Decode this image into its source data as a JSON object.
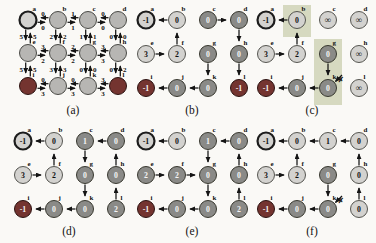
{
  "figure": {
    "colors": {
      "node_light": "#d3d2cf",
      "node_mid": "#b7b6b3",
      "node_dark": "#8a8a87",
      "node_red": "#743430",
      "source_ring": "#1c1c1c",
      "edge": "#141414",
      "shade": "#d6d9c0",
      "text_dark": "#111111",
      "text_light": "#f5f5f5",
      "label": "#111111"
    },
    "panels": [
      {
        "id": "a",
        "caption": "(a)",
        "type": "weighted",
        "nodes": [
          {
            "id": "a",
            "col": 0,
            "row": 0,
            "style": "source"
          },
          {
            "id": "b",
            "col": 1,
            "row": 0,
            "style": "mid"
          },
          {
            "id": "c",
            "col": 2,
            "row": 0,
            "style": "mid"
          },
          {
            "id": "d",
            "col": 3,
            "row": 0,
            "style": "mid"
          },
          {
            "id": "e",
            "col": 0,
            "row": 1,
            "style": "mid"
          },
          {
            "id": "f",
            "col": 1,
            "row": 1,
            "style": "mid"
          },
          {
            "id": "g",
            "col": 2,
            "row": 1,
            "style": "mid"
          },
          {
            "id": "h",
            "col": 3,
            "row": 1,
            "style": "mid"
          },
          {
            "id": "i",
            "col": 0,
            "row": 2,
            "style": "red"
          },
          {
            "id": "j",
            "col": 1,
            "row": 2,
            "style": "mid"
          },
          {
            "id": "k",
            "col": 2,
            "row": 2,
            "style": "mid"
          },
          {
            "id": "l",
            "col": 3,
            "row": 2,
            "style": "red"
          }
        ],
        "weighted_edges": [
          {
            "between": [
              "a",
              "b"
            ],
            "w1": "0",
            "w2": "0"
          },
          {
            "between": [
              "b",
              "c"
            ],
            "w1": "1",
            "w2": "1"
          },
          {
            "between": [
              "c",
              "d"
            ],
            "w1": "0",
            "w2": "0"
          },
          {
            "between": [
              "e",
              "f"
            ],
            "w1": "3",
            "w2": "2"
          },
          {
            "between": [
              "f",
              "g"
            ],
            "w1": "2",
            "w2": "2"
          },
          {
            "between": [
              "g",
              "h"
            ],
            "w1": "3",
            "w2": "3"
          },
          {
            "between": [
              "i",
              "j"
            ],
            "w1": "0",
            "w2": "3"
          },
          {
            "between": [
              "j",
              "k"
            ],
            "w1": "0",
            "w2": "3"
          },
          {
            "between": [
              "k",
              "l"
            ],
            "w1": "3",
            "w2": "3"
          },
          {
            "between": [
              "a",
              "e"
            ],
            "w1": "5",
            "w2": "5"
          },
          {
            "between": [
              "e",
              "i"
            ],
            "w1": "5",
            "w2": "5"
          },
          {
            "between": [
              "b",
              "f"
            ],
            "w1": "2",
            "w2": "2"
          },
          {
            "between": [
              "f",
              "j"
            ],
            "w1": "3",
            "w2": "3"
          },
          {
            "between": [
              "c",
              "g"
            ],
            "w1": "1",
            "w2": "1"
          },
          {
            "between": [
              "g",
              "k"
            ],
            "w1": "0",
            "w2": "0"
          },
          {
            "between": [
              "d",
              "h"
            ],
            "w1": "0",
            "w2": "0"
          },
          {
            "between": [
              "h",
              "l"
            ],
            "w1": "0",
            "w2": "2"
          }
        ]
      },
      {
        "id": "b",
        "caption": "(b)",
        "type": "tree",
        "nodes": [
          {
            "id": "a",
            "col": 0,
            "row": 0,
            "style": "source",
            "value": "-1"
          },
          {
            "id": "b",
            "col": 1,
            "row": 0,
            "style": "light",
            "value": "0"
          },
          {
            "id": "c",
            "col": 2,
            "row": 0,
            "style": "dark",
            "value": "0"
          },
          {
            "id": "d",
            "col": 3,
            "row": 0,
            "style": "dark",
            "value": "0"
          },
          {
            "id": "e",
            "col": 0,
            "row": 1,
            "style": "light",
            "value": "3"
          },
          {
            "id": "f",
            "col": 1,
            "row": 1,
            "style": "light",
            "value": "2"
          },
          {
            "id": "g",
            "col": 2,
            "row": 1,
            "style": "dark",
            "value": "0"
          },
          {
            "id": "h",
            "col": 3,
            "row": 1,
            "style": "dark",
            "value": "0"
          },
          {
            "id": "i",
            "col": 0,
            "row": 2,
            "style": "red",
            "value": "-1"
          },
          {
            "id": "j",
            "col": 1,
            "row": 2,
            "style": "dark",
            "value": "0"
          },
          {
            "id": "k",
            "col": 2,
            "row": 2,
            "style": "dark",
            "value": "0"
          },
          {
            "id": "l",
            "col": 3,
            "row": 2,
            "style": "red",
            "value": "-1"
          }
        ],
        "edges": [
          {
            "from": "b",
            "to": "a"
          },
          {
            "from": "c",
            "to": "d"
          },
          {
            "from": "d",
            "to": "h"
          },
          {
            "from": "h",
            "to": "l"
          },
          {
            "from": "e",
            "to": "f"
          },
          {
            "from": "f",
            "to": "b"
          },
          {
            "from": "g",
            "to": "k"
          },
          {
            "from": "k",
            "to": "j"
          },
          {
            "from": "j",
            "to": "i"
          }
        ]
      },
      {
        "id": "c",
        "caption": "(c)",
        "type": "tree",
        "shades": [
          {
            "col": 1,
            "row0": 0,
            "row1": 0
          },
          {
            "col": 2,
            "row0": 1,
            "row1": 2
          }
        ],
        "nodes": [
          {
            "id": "a",
            "col": 0,
            "row": 0,
            "style": "source",
            "value": "-1"
          },
          {
            "id": "b",
            "col": 1,
            "row": 0,
            "style": "light",
            "value": "0"
          },
          {
            "id": "c",
            "col": 2,
            "row": 0,
            "style": "light",
            "value": "∞"
          },
          {
            "id": "d",
            "col": 3,
            "row": 0,
            "style": "light",
            "value": "∞"
          },
          {
            "id": "e",
            "col": 0,
            "row": 1,
            "style": "light",
            "value": "3"
          },
          {
            "id": "f",
            "col": 1,
            "row": 1,
            "style": "light",
            "value": "2"
          },
          {
            "id": "g",
            "col": 2,
            "row": 1,
            "style": "dark",
            "value": "0"
          },
          {
            "id": "h",
            "col": 3,
            "row": 1,
            "style": "light",
            "value": "∞"
          },
          {
            "id": "i",
            "col": 0,
            "row": 2,
            "style": "red",
            "value": "-1"
          },
          {
            "id": "j",
            "col": 1,
            "row": 2,
            "style": "dark",
            "value": "0"
          },
          {
            "id": "k",
            "col": 2,
            "row": 2,
            "style": "dark",
            "value": "0"
          },
          {
            "id": "l",
            "col": 3,
            "row": 2,
            "style": "light",
            "value": "∞"
          }
        ],
        "edges": [
          {
            "from": "b",
            "to": "a"
          },
          {
            "from": "e",
            "to": "f"
          },
          {
            "from": "f",
            "to": "b"
          },
          {
            "from": "g",
            "to": "k"
          },
          {
            "from": "k",
            "to": "j"
          },
          {
            "from": "j",
            "to": "i"
          }
        ],
        "marks": [
          {
            "at": "k",
            "glyph": "✗"
          }
        ]
      },
      {
        "id": "d",
        "caption": "(d)",
        "type": "tree",
        "nodes": [
          {
            "id": "a",
            "col": 0,
            "row": 0,
            "style": "source",
            "value": "-1"
          },
          {
            "id": "b",
            "col": 1,
            "row": 0,
            "style": "light",
            "value": "0"
          },
          {
            "id": "c",
            "col": 2,
            "row": 0,
            "style": "dark",
            "value": "1"
          },
          {
            "id": "d",
            "col": 3,
            "row": 0,
            "style": "dark",
            "value": "0"
          },
          {
            "id": "e",
            "col": 0,
            "row": 1,
            "style": "light",
            "value": "3"
          },
          {
            "id": "f",
            "col": 1,
            "row": 1,
            "style": "light",
            "value": "2"
          },
          {
            "id": "g",
            "col": 2,
            "row": 1,
            "style": "dark",
            "value": "0"
          },
          {
            "id": "h",
            "col": 3,
            "row": 1,
            "style": "dark",
            "value": "0"
          },
          {
            "id": "i",
            "col": 0,
            "row": 2,
            "style": "red",
            "value": "-1"
          },
          {
            "id": "j",
            "col": 1,
            "row": 2,
            "style": "dark",
            "value": "0"
          },
          {
            "id": "k",
            "col": 2,
            "row": 2,
            "style": "dark",
            "value": "0"
          },
          {
            "id": "l",
            "col": 3,
            "row": 2,
            "style": "dark",
            "value": "2"
          }
        ],
        "edges": [
          {
            "from": "b",
            "to": "a"
          },
          {
            "from": "d",
            "to": "c"
          },
          {
            "from": "c",
            "to": "g"
          },
          {
            "from": "e",
            "to": "f"
          },
          {
            "from": "f",
            "to": "b"
          },
          {
            "from": "g",
            "to": "k"
          },
          {
            "from": "h",
            "to": "d"
          },
          {
            "from": "l",
            "to": "h"
          },
          {
            "from": "k",
            "to": "j"
          },
          {
            "from": "j",
            "to": "i"
          }
        ]
      },
      {
        "id": "e",
        "caption": "(e)",
        "type": "tree",
        "nodes": [
          {
            "id": "a",
            "col": 0,
            "row": 0,
            "style": "source",
            "value": "-1"
          },
          {
            "id": "b",
            "col": 1,
            "row": 0,
            "style": "light",
            "value": "0"
          },
          {
            "id": "c",
            "col": 2,
            "row": 0,
            "style": "dark",
            "value": "1"
          },
          {
            "id": "d",
            "col": 3,
            "row": 0,
            "style": "dark",
            "value": "0"
          },
          {
            "id": "e",
            "col": 0,
            "row": 1,
            "style": "dark",
            "value": "2"
          },
          {
            "id": "f",
            "col": 1,
            "row": 1,
            "style": "dark",
            "value": "2"
          },
          {
            "id": "g",
            "col": 2,
            "row": 1,
            "style": "dark",
            "value": "0"
          },
          {
            "id": "h",
            "col": 3,
            "row": 1,
            "style": "dark",
            "value": "0"
          },
          {
            "id": "i",
            "col": 0,
            "row": 2,
            "style": "red",
            "value": "-1"
          },
          {
            "id": "j",
            "col": 1,
            "row": 2,
            "style": "dark",
            "value": "0"
          },
          {
            "id": "k",
            "col": 2,
            "row": 2,
            "style": "dark",
            "value": "0"
          },
          {
            "id": "l",
            "col": 3,
            "row": 2,
            "style": "dark",
            "value": "2"
          }
        ],
        "edges": [
          {
            "from": "b",
            "to": "a"
          },
          {
            "from": "d",
            "to": "c"
          },
          {
            "from": "c",
            "to": "g"
          },
          {
            "from": "e",
            "to": "f"
          },
          {
            "from": "f",
            "to": "g"
          },
          {
            "from": "g",
            "to": "k"
          },
          {
            "from": "h",
            "to": "d"
          },
          {
            "from": "l",
            "to": "h"
          },
          {
            "from": "k",
            "to": "j"
          },
          {
            "from": "j",
            "to": "i"
          }
        ]
      },
      {
        "id": "f",
        "caption": "(f)",
        "type": "tree",
        "nodes": [
          {
            "id": "a",
            "col": 0,
            "row": 0,
            "style": "source",
            "value": "-1"
          },
          {
            "id": "b",
            "col": 1,
            "row": 0,
            "style": "light",
            "value": "0"
          },
          {
            "id": "c",
            "col": 2,
            "row": 0,
            "style": "light",
            "value": "1"
          },
          {
            "id": "d",
            "col": 3,
            "row": 0,
            "style": "light",
            "value": "0"
          },
          {
            "id": "e",
            "col": 0,
            "row": 1,
            "style": "light",
            "value": "3"
          },
          {
            "id": "f",
            "col": 1,
            "row": 1,
            "style": "light",
            "value": "2"
          },
          {
            "id": "g",
            "col": 2,
            "row": 1,
            "style": "dark",
            "value": "0"
          },
          {
            "id": "h",
            "col": 3,
            "row": 1,
            "style": "light",
            "value": "0"
          },
          {
            "id": "i",
            "col": 0,
            "row": 2,
            "style": "red",
            "value": "-1"
          },
          {
            "id": "j",
            "col": 1,
            "row": 2,
            "style": "dark",
            "value": "0"
          },
          {
            "id": "k",
            "col": 2,
            "row": 2,
            "style": "dark",
            "value": "0"
          },
          {
            "id": "l",
            "col": 3,
            "row": 2,
            "style": "light",
            "value": "0"
          }
        ],
        "edges": [
          {
            "from": "b",
            "to": "a"
          },
          {
            "from": "c",
            "to": "b"
          },
          {
            "from": "d",
            "to": "c"
          },
          {
            "from": "e",
            "to": "f"
          },
          {
            "from": "f",
            "to": "b"
          },
          {
            "from": "g",
            "to": "k"
          },
          {
            "from": "h",
            "to": "d"
          },
          {
            "from": "l",
            "to": "h"
          },
          {
            "from": "k",
            "to": "j"
          },
          {
            "from": "j",
            "to": "i"
          }
        ],
        "marks": [
          {
            "at": "k",
            "glyph": "✗"
          }
        ]
      }
    ]
  }
}
